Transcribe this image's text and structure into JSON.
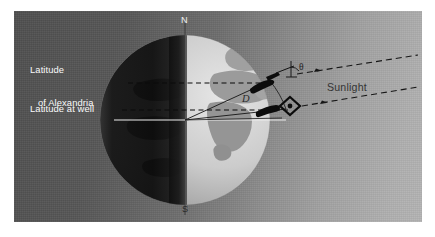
{
  "figure": {
    "kind": "eratosthenes-earth-circumference-diagram",
    "panel": {
      "background_left_color": "#4f4f4f",
      "background_right_color": "#b4b4b4",
      "border_color": "#ffffff"
    }
  },
  "labels": {
    "latitude_alexandria_line1": "Latitude",
    "latitude_alexandria_line2": "of Alexandria",
    "latitude_well": "Latitude at well",
    "north_pole": "N",
    "south_pole": "S",
    "sunlight": "Sunlight",
    "distance": "D",
    "angle": "θ"
  },
  "globe": {
    "center_x": 185,
    "center_y": 120,
    "radius": 85,
    "night_color": "#121212",
    "day_ocean_color": "#cfcfcf",
    "land_color": "#9a9a9a",
    "terminator_x": 185
  },
  "markers": {
    "obelisk": {
      "name": "obelisk-at-alexandria",
      "x": 258,
      "y": 72,
      "color": "#0d0d0d"
    },
    "well": {
      "name": "well-marker",
      "x": 277,
      "y": 104,
      "color": "#0d0d0d"
    }
  },
  "lines": {
    "latitude_alexandria_y": 83,
    "latitude_well_y": 110,
    "equator_y": 120,
    "dashed_color": "#0a0a0a",
    "solid_color": "#f0f0f0",
    "sunray_color": "#1a1a1a"
  },
  "colors": {
    "text_light": "#fafafa",
    "text_dark": "#2a2a2a",
    "panel_border": "#ffffff"
  }
}
